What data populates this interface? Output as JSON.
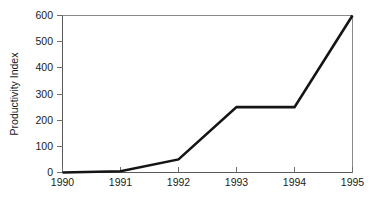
{
  "chart_data": {
    "type": "line",
    "title": "",
    "xlabel": "",
    "ylabel": "Productivity Index",
    "categories": [
      "1990",
      "1991",
      "1992",
      "1993",
      "1994",
      "1995"
    ],
    "x": [
      1990,
      1991,
      1992,
      1993,
      1994,
      1995
    ],
    "values": [
      0,
      5,
      50,
      250,
      250,
      600
    ],
    "series": [
      {
        "name": "Productivity Index",
        "values": [
          0,
          5,
          50,
          250,
          250,
          600
        ]
      }
    ],
    "xlim": [
      1990,
      1995
    ],
    "ylim": [
      0,
      600
    ],
    "ytick_labels": [
      "0",
      "100",
      "200",
      "300",
      "400",
      "500",
      "600"
    ],
    "ytick_values": [
      0,
      100,
      200,
      300,
      400,
      500,
      600
    ],
    "xtick_labels": [
      "1990",
      "1991",
      "1992",
      "1993",
      "1994",
      "1995"
    ],
    "grid": false,
    "legend": "none",
    "line_color": "#151515",
    "frame_color": "#8a8a8a",
    "background_color": "#ffffff"
  },
  "axes": {
    "y_title": "Productivity Index",
    "y_ticks": [
      {
        "label": "600",
        "value": 600
      },
      {
        "label": "500",
        "value": 500
      },
      {
        "label": "400",
        "value": 400
      },
      {
        "label": "300",
        "value": 300
      },
      {
        "label": "200",
        "value": 200
      },
      {
        "label": "100",
        "value": 100
      },
      {
        "label": "0",
        "value": 0
      }
    ],
    "x_ticks": [
      {
        "label": "1990",
        "value": 1990
      },
      {
        "label": "1991",
        "value": 1991
      },
      {
        "label": "1992",
        "value": 1992
      },
      {
        "label": "1993",
        "value": 1993
      },
      {
        "label": "1994",
        "value": 1994
      },
      {
        "label": "1995",
        "value": 1995
      }
    ]
  }
}
